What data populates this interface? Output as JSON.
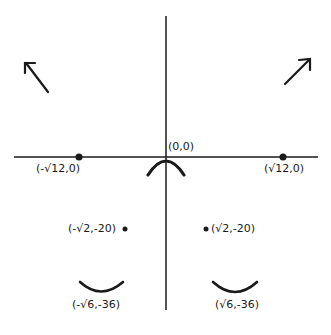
{
  "diagram": {
    "type": "hand-drawn sketch of a curve's key features",
    "axes": {
      "x_axis": "horizontal line",
      "y_axis": "vertical line",
      "origin_label": "(0,0)"
    },
    "end_behavior": [
      {
        "side": "left",
        "direction": "up-left",
        "icon": "arrow-up-left"
      },
      {
        "side": "right",
        "direction": "up-right",
        "icon": "arrow-up-right"
      }
    ],
    "points": [
      {
        "label": "(-√12,0)",
        "kind": "x-intercept dot"
      },
      {
        "label": "(√12,0)",
        "kind": "x-intercept dot"
      },
      {
        "label": "(0,0)",
        "kind": "local max (concave down arc)"
      },
      {
        "label": "(-√2,-20)",
        "kind": "inflection point dot"
      },
      {
        "label": "(√2,-20)",
        "kind": "inflection point dot"
      },
      {
        "label": "(-√6,-36)",
        "kind": "local min (concave up arc)"
      },
      {
        "label": "(√6,-36)",
        "kind": "local min (concave up arc)"
      }
    ]
  },
  "labels": {
    "origin": "(0,0)",
    "x_int_left": "(-√12,0)",
    "x_int_right": "(√12,0)",
    "infl_left": "(-√2,-20)",
    "infl_right": "(√2,-20)",
    "min_left": "(-√6,-36)",
    "min_right": "(√6,-36)"
  },
  "colors": {
    "ink": "#1a1a1a",
    "background": "#ffffff"
  }
}
